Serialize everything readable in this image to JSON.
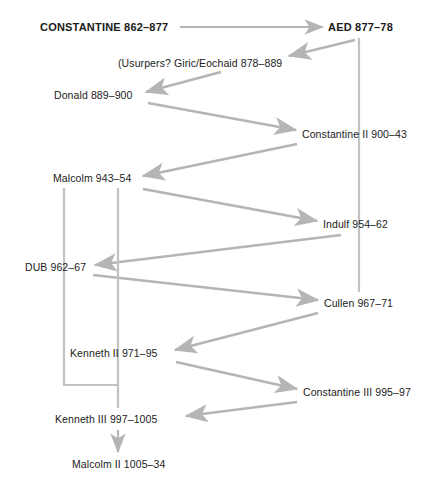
{
  "diagram": {
    "width": 437,
    "height": 492,
    "background": "#ffffff",
    "edge_color": "#b5b5b5",
    "text_color": "#1b1b1b",
    "nodes": [
      {
        "id": "constantine1",
        "label": "CONSTANTINE 862–877",
        "x": 40,
        "y": 27,
        "bold": true
      },
      {
        "id": "aed",
        "label": "AED 877–78",
        "x": 328,
        "y": 27,
        "bold": true
      },
      {
        "id": "usurpers",
        "label": "(Usurpers? Giric/Eochaid 878–889",
        "x": 118,
        "y": 63,
        "bold": false
      },
      {
        "id": "donald",
        "label": "Donald 889–900",
        "x": 54,
        "y": 95,
        "bold": false
      },
      {
        "id": "constantine2",
        "label": "Constantine II 900–43",
        "x": 302,
        "y": 134,
        "bold": false
      },
      {
        "id": "malcolm",
        "label": "Malcolm 943–54",
        "x": 53,
        "y": 178,
        "bold": false
      },
      {
        "id": "indulf",
        "label": "Indulf 954–62",
        "x": 323,
        "y": 224,
        "bold": false
      },
      {
        "id": "dub",
        "label": "DUB 962–67",
        "x": 25,
        "y": 267,
        "bold": false
      },
      {
        "id": "cullen",
        "label": "Cullen 967–71",
        "x": 324,
        "y": 303,
        "bold": false
      },
      {
        "id": "kenneth2",
        "label": "Kenneth II 971–95",
        "x": 70,
        "y": 353,
        "bold": false
      },
      {
        "id": "constantine3",
        "label": "Constantine III 995–97",
        "x": 303,
        "y": 392,
        "bold": false
      },
      {
        "id": "kenneth3",
        "label": "Kenneth III 997–1005",
        "x": 55,
        "y": 419,
        "bold": false
      },
      {
        "id": "malcolm2",
        "label": "Malcolm II 1005–34",
        "x": 72,
        "y": 464,
        "bold": false
      }
    ],
    "edges": [
      {
        "id": "constantine1-to-aed",
        "from": "constantine1",
        "to": "aed",
        "kind": "arrow-horizontal"
      },
      {
        "id": "aed-to-usurpers",
        "from": "aed",
        "to": "usurpers",
        "kind": "arrow-diagonal"
      },
      {
        "id": "usurpers-to-donald",
        "from": "usurpers",
        "to": "donald",
        "kind": "arrow-diagonal"
      },
      {
        "id": "donald-to-constantine2",
        "from": "donald",
        "to": "constantine2",
        "kind": "arrow-diagonal"
      },
      {
        "id": "aed-to-cullen-line",
        "from": "aed",
        "to": "cullen",
        "kind": "plain-vertical"
      },
      {
        "id": "constantine2-to-malcolm",
        "from": "constantine2",
        "to": "malcolm",
        "kind": "arrow-diagonal"
      },
      {
        "id": "malcolm-to-indulf",
        "from": "malcolm",
        "to": "indulf",
        "kind": "arrow-diagonal"
      },
      {
        "id": "indulf-to-dub",
        "from": "indulf",
        "to": "dub",
        "kind": "arrow-diagonal"
      },
      {
        "id": "dub-to-cullen",
        "from": "dub",
        "to": "cullen",
        "kind": "arrow-diagonal"
      },
      {
        "id": "cullen-to-kenneth2",
        "from": "cullen",
        "to": "kenneth2",
        "kind": "arrow-diagonal"
      },
      {
        "id": "kenneth2-to-constantine3",
        "from": "kenneth2",
        "to": "constantine3",
        "kind": "arrow-diagonal"
      },
      {
        "id": "constantine3-to-kenneth3",
        "from": "constantine3",
        "to": "kenneth3",
        "kind": "arrow-diagonal"
      },
      {
        "id": "malcolm-to-dub-line",
        "from": "malcolm",
        "to": "dub",
        "kind": "plain-vertical"
      },
      {
        "id": "malcolm-to-kenneth2-line",
        "from": "malcolm",
        "to": "kenneth2",
        "kind": "plain-vertical"
      },
      {
        "id": "dub-to-kenneth3-elbow",
        "from": "dub",
        "to": "kenneth3",
        "kind": "plain-elbow"
      },
      {
        "id": "kenneth3-to-malcolm2",
        "from": "kenneth3",
        "to": "malcolm2",
        "kind": "arrow-vertical"
      }
    ]
  }
}
